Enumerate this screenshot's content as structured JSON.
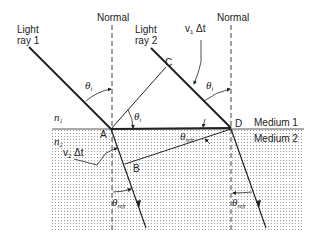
{
  "diagram": {
    "type": "refraction-huygens-wavefront",
    "labels": {
      "normal_left": "Normal",
      "normal_right": "Normal",
      "ray1_line1": "Light",
      "ray1_line2": "ray 1",
      "ray2_line1": "Light",
      "ray2_line2": "ray 2",
      "v1dt": "v",
      "v1dt_sub": "1",
      "v1dt_tail": " Δt",
      "v2dt": "v",
      "v2dt_sub": "2",
      "v2dt_tail": " Δt",
      "n1": "n",
      "n1_sub": "1",
      "n2": "n",
      "n2_sub": "2",
      "point_A": "A",
      "point_B": "B",
      "point_C": "C",
      "point_D": "D",
      "medium1": "Medium 1",
      "medium2": "Medium 2",
      "theta": "θ",
      "theta_i_sub": "i",
      "theta_refr_sub": "refr"
    },
    "colors": {
      "line": "#222222",
      "dots": "#9a9a9a",
      "background": "#ffffff"
    }
  }
}
